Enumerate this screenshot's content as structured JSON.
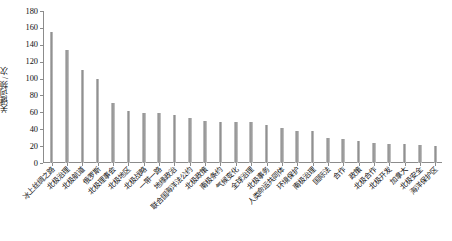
{
  "chart_data": {
    "type": "bar",
    "title": "",
    "xlabel": "",
    "ylabel": "关键词频 / 次",
    "ylim": [
      0,
      180
    ],
    "ytick_step": 20,
    "yticks": [
      0,
      20,
      40,
      60,
      80,
      100,
      120,
      140,
      160,
      180
    ],
    "grid": false,
    "legend": false,
    "bar_color": "#9a9a9a",
    "categories": [
      "冰上丝绸之路",
      "北极治理",
      "北极航道",
      "俄罗斯",
      "北极理事会",
      "北极地区",
      "北极战略",
      "一带一路",
      "地缘政治",
      "联合国海洋法公约",
      "北极政策",
      "南极条约",
      "气候变化",
      "全球治理",
      "北极事务",
      "人类命运共同体",
      "环境保护",
      "南极治理",
      "国际法",
      "合作",
      "政策",
      "北极合作",
      "北极开发",
      "加拿大",
      "北极安全",
      "海洋保护区"
    ],
    "values": [
      155,
      134,
      110,
      100,
      71,
      62,
      59,
      59,
      57,
      53,
      50,
      48,
      48,
      48,
      45,
      41,
      38,
      38,
      30,
      28,
      26,
      24,
      23,
      22,
      21,
      20
    ],
    "series": [
      {
        "name": "关键词频",
        "values": [
          155,
          134,
          110,
          100,
          71,
          62,
          59,
          59,
          57,
          53,
          50,
          48,
          48,
          48,
          45,
          41,
          38,
          38,
          30,
          28,
          26,
          24,
          23,
          22,
          21,
          20
        ]
      }
    ]
  }
}
